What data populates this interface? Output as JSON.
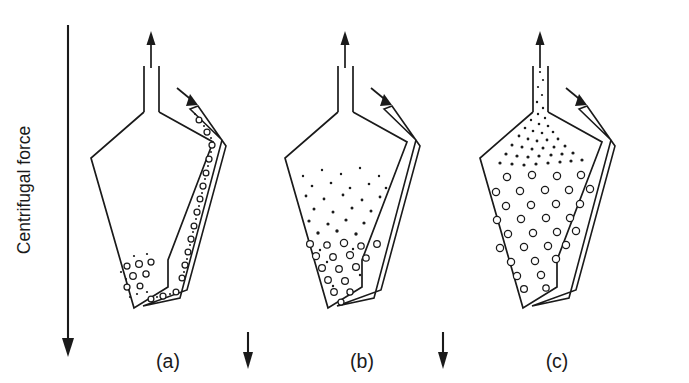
{
  "figure": {
    "background_color": "#ffffff",
    "ink_color": "#1a1a1a",
    "force_axis": {
      "label": "Centrifugal force",
      "direction": "down",
      "arrow_x": 68,
      "arrow_top_y": 25,
      "arrow_bottom_y": 356,
      "label_x": 30,
      "label_y": 190
    },
    "panels": [
      {
        "id": "a",
        "label": "(a)",
        "label_x": 168,
        "label_y": 368,
        "caption_state": "Bubbles held in the inclined inlet duct and collected at the bottom of the vessel",
        "origin_x": 88,
        "outlet_arrow": {
          "label": "outlet-flow-arrow",
          "direction": "up"
        },
        "inlet_arrow": {
          "label": "inlet-flow-arrow",
          "direction": "down-right"
        },
        "duct_filled": true,
        "body_specks": false,
        "body_rings": "bottom-corner",
        "neck_specks": false,
        "force_arrow_after": {
          "x": 248,
          "top_y": 332,
          "bottom_y": 368
        }
      },
      {
        "id": "b",
        "label": "(b)",
        "label_x": 362,
        "label_y": 368,
        "caption_state": "Bubbles dispersed through the vessel, fine specks above and coarse rings settling low",
        "origin_x": 282,
        "outlet_arrow": {
          "label": "outlet-flow-arrow",
          "direction": "up"
        },
        "inlet_arrow": {
          "label": "inlet-flow-arrow",
          "direction": "down-right"
        },
        "duct_filled": false,
        "body_specks": true,
        "body_rings": "graded",
        "neck_specks": false,
        "force_arrow_after": {
          "x": 443,
          "top_y": 332,
          "bottom_y": 368
        }
      },
      {
        "id": "c",
        "label": "(c)",
        "label_x": 557,
        "label_y": 368,
        "caption_state": "Vessel filled with uniform bubbles, fine specks escaping upward through the neck",
        "origin_x": 477,
        "outlet_arrow": {
          "label": "outlet-flow-arrow",
          "direction": "up"
        },
        "inlet_arrow": {
          "label": "inlet-flow-arrow",
          "direction": "down-right"
        },
        "duct_filled": false,
        "body_specks": false,
        "body_rings": "uniform",
        "neck_specks": true,
        "force_arrow_after": null
      }
    ]
  }
}
